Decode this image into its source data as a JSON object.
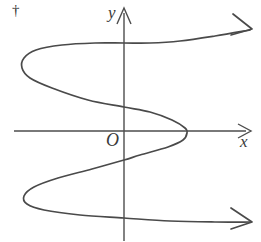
{
  "figure": {
    "footnote_marker": "†",
    "origin_label": "O",
    "x_axis_label": "x",
    "y_axis_label": "y",
    "colors": {
      "axis": "#4d4d4d",
      "curve": "#4a4a4a",
      "background": "#ffffff",
      "text": "#3a3a3a"
    }
  },
  "chart_data": {
    "type": "line",
    "title": "",
    "subtitle": "",
    "xlabel": "x",
    "ylabel": "y",
    "origin_label": "O",
    "grid": false,
    "legend": "none",
    "annotations": [
      "†"
    ],
    "axes": {
      "x_axis": {
        "start_px": [
          14,
          131
        ],
        "end_px": [
          250,
          131
        ],
        "arrow": "right"
      },
      "y_axis": {
        "start_px": [
          124,
          240
        ],
        "end_px": [
          124,
          8
        ],
        "arrow": "up"
      },
      "origin_px": [
        124,
        131
      ]
    },
    "series": [
      {
        "name": "curve",
        "arrow_start": false,
        "arrow_end": true,
        "points_px": [
          [
            250,
            30
          ],
          [
            215,
            36
          ],
          [
            180,
            41
          ],
          [
            150,
            43
          ],
          [
            124,
            43
          ],
          [
            95,
            43
          ],
          [
            62,
            45
          ],
          [
            36,
            50
          ],
          [
            24,
            58
          ],
          [
            22,
            68
          ],
          [
            30,
            78
          ],
          [
            52,
            88
          ],
          [
            88,
            100
          ],
          [
            124,
            107
          ],
          [
            150,
            112
          ],
          [
            172,
            120
          ],
          [
            185,
            128
          ],
          [
            187,
            133
          ],
          [
            183,
            140
          ],
          [
            168,
            147
          ],
          [
            140,
            155
          ],
          [
            124,
            160
          ],
          [
            92,
            169
          ],
          [
            58,
            178
          ],
          [
            34,
            187
          ],
          [
            24,
            196
          ],
          [
            27,
            204
          ],
          [
            44,
            210
          ],
          [
            80,
            215
          ],
          [
            124,
            218
          ],
          [
            170,
            221
          ],
          [
            215,
            222
          ],
          [
            250,
            222
          ]
        ],
        "x_axis_crossings_px": [
          [
            187,
            131
          ]
        ],
        "y_axis_crossings_px": [
          [
            124,
            43
          ],
          [
            124,
            107
          ],
          [
            124,
            160
          ],
          [
            124,
            218
          ]
        ],
        "turning_points_px": [
          [
            22,
            64
          ],
          [
            187,
            131
          ],
          [
            24,
            200
          ]
        ]
      }
    ]
  }
}
